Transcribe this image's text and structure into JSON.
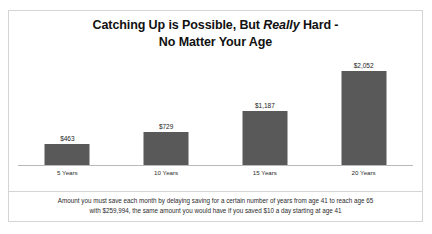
{
  "chart_data": {
    "type": "bar",
    "title_line1_before": "Catching Up is Possible, But ",
    "title_emphasis": "Really",
    "title_line1_after": " Hard -",
    "title_line2": "No Matter Your Age",
    "title": "Catching Up is Possible, But Really Hard - No Matter Your Age",
    "categories": [
      "5 Years",
      "10 Years",
      "15 Years",
      "20 Years"
    ],
    "values": [
      463,
      1187,
      2052,
      729
    ],
    "data_labels": [
      "$463",
      "$729",
      "$1,187",
      "$2,052"
    ],
    "series": [
      {
        "name": "Amount you must save each month",
        "values": [
          463,
          729,
          1187,
          2052
        ]
      }
    ],
    "xlabel": "",
    "ylabel": "",
    "ylim": [
      0,
      2052
    ],
    "grid": false,
    "legend": "none",
    "bar_color": "#595959",
    "axis_color": "#b9b9b9"
  },
  "footnote": {
    "line1": "Amount you must save each month by delaying saving for a certain number of years from age 41 to reach age 65",
    "line2": "with $259,994, the same amount you would have if you saved $10 a day starting at age 41"
  }
}
